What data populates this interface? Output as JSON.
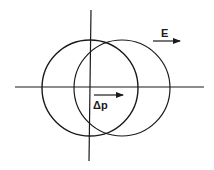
{
  "diagram": {
    "colors": {
      "stroke": "#1a1a1a",
      "background": "#ffffff"
    },
    "axes": {
      "horizontal": {
        "x1": 15,
        "y1": 87,
        "x2": 204,
        "y2": 87
      },
      "vertical": {
        "x1": 91,
        "y1": 10,
        "x2": 89,
        "y2": 161
      }
    },
    "circles": [
      {
        "name": "original",
        "cx": 90,
        "cy": 88,
        "r": 48
      },
      {
        "name": "shifted",
        "cx": 122,
        "cy": 88,
        "r": 48
      }
    ],
    "labels": {
      "field": {
        "text": "E",
        "x": 161,
        "y": 36
      },
      "momentum_shift": {
        "text": "Δp",
        "x": 93,
        "y": 109
      }
    },
    "arrows": {
      "field": {
        "x1": 153,
        "y1": 41,
        "x2": 180,
        "y2": 41
      },
      "momentum_shift": {
        "x1": 94,
        "y1": 95,
        "x2": 123,
        "y2": 95
      }
    }
  }
}
